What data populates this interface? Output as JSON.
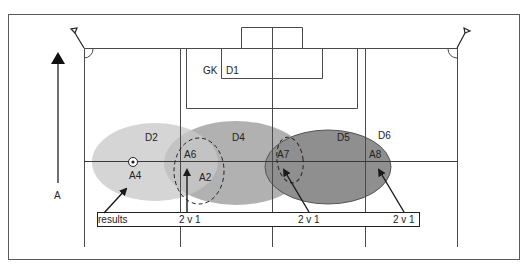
{
  "diagram": {
    "type": "soccer-tactics",
    "colors": {
      "line": "#4a4a4a",
      "frame": "#5a5a5a",
      "zone_light": "#d9d9d9",
      "zone_mid": "#a8a8a8",
      "zone_dark": "#8e8e8e",
      "arrow": "#1a1a1a"
    },
    "direction_arrow": {
      "label": "A"
    },
    "goal_labels": {
      "goalkeeper": "GK",
      "defender1": "D1"
    },
    "zones": [
      {
        "id": "D2",
        "label": "D2",
        "shade": "light"
      },
      {
        "id": "D4",
        "label": "D4",
        "shade": "mid"
      },
      {
        "id": "D5",
        "label": "D5",
        "shade": "dark"
      },
      {
        "id": "D6",
        "label": "D6"
      }
    ],
    "attackers": [
      {
        "id": "A4",
        "label": "A4",
        "has_ball": true
      },
      {
        "id": "A6",
        "label": "A6"
      },
      {
        "id": "A2",
        "label": "A2"
      },
      {
        "id": "A7",
        "label": "A7"
      },
      {
        "id": "A8",
        "label": "A8"
      }
    ],
    "results_bar": {
      "label": "results",
      "outcomes": [
        "2 v 1",
        "2 v 1",
        "2 v 1"
      ]
    },
    "icons": {
      "ball": "soccer-ball-icon",
      "corner_flag": "corner-flag-icon"
    }
  }
}
